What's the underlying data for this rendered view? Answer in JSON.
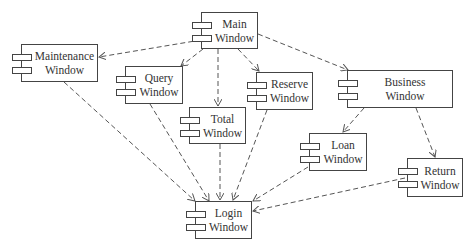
{
  "diagram": {
    "type": "UML component diagram",
    "line_color": "#555555",
    "components": [
      {
        "id": "main",
        "label": "Main\nWindow",
        "x": 201,
        "y": 12,
        "w": 57,
        "h": 37
      },
      {
        "id": "maintenance",
        "label": "Maintenance\nWindow",
        "x": 21,
        "y": 44,
        "w": 77,
        "h": 38
      },
      {
        "id": "query",
        "label": "Query\nWindow",
        "x": 125,
        "y": 66,
        "w": 58,
        "h": 38
      },
      {
        "id": "total",
        "label": "Total\nWindow",
        "x": 189,
        "y": 107,
        "w": 57,
        "h": 37
      },
      {
        "id": "reserve",
        "label": "Reserve\nWindow",
        "x": 256,
        "y": 72,
        "w": 57,
        "h": 38
      },
      {
        "id": "business",
        "label": "Business\nWindow",
        "x": 347,
        "y": 70,
        "w": 106,
        "h": 38
      },
      {
        "id": "loan",
        "label": "Loan\nWindow",
        "x": 309,
        "y": 133,
        "w": 58,
        "h": 38
      },
      {
        "id": "return",
        "label": "Return\nWindow",
        "x": 407,
        "y": 158,
        "w": 56,
        "h": 39
      },
      {
        "id": "login",
        "label": "Login\nWindow",
        "x": 195,
        "y": 201,
        "w": 57,
        "h": 38
      }
    ],
    "dependencies": [
      {
        "from": "main",
        "to": "maintenance",
        "x1": 201,
        "y1": 40,
        "x2": 99,
        "y2": 57
      },
      {
        "from": "main",
        "to": "query",
        "x1": 203,
        "y1": 49,
        "x2": 181,
        "y2": 66
      },
      {
        "from": "main",
        "to": "total",
        "x1": 218,
        "y1": 49,
        "x2": 218,
        "y2": 106
      },
      {
        "from": "main",
        "to": "reserve",
        "x1": 238,
        "y1": 49,
        "x2": 259,
        "y2": 71
      },
      {
        "from": "main",
        "to": "business",
        "x1": 258,
        "y1": 34,
        "x2": 348,
        "y2": 70
      },
      {
        "from": "business",
        "to": "loan",
        "x1": 364,
        "y1": 108,
        "x2": 343,
        "y2": 132
      },
      {
        "from": "business",
        "to": "return",
        "x1": 416,
        "y1": 108,
        "x2": 435,
        "y2": 157
      },
      {
        "from": "maintenance",
        "to": "login",
        "x1": 64,
        "y1": 82,
        "x2": 195,
        "y2": 201
      },
      {
        "from": "query",
        "to": "login",
        "x1": 150,
        "y1": 104,
        "x2": 209,
        "y2": 201
      },
      {
        "from": "total",
        "to": "login",
        "x1": 220,
        "y1": 144,
        "x2": 220,
        "y2": 200
      },
      {
        "from": "reserve",
        "to": "login",
        "x1": 267,
        "y1": 110,
        "x2": 233,
        "y2": 200
      },
      {
        "from": "loan",
        "to": "login",
        "x1": 308,
        "y1": 167,
        "x2": 253,
        "y2": 201
      },
      {
        "from": "return",
        "to": "login",
        "x1": 405,
        "y1": 178,
        "x2": 253,
        "y2": 211
      }
    ]
  }
}
